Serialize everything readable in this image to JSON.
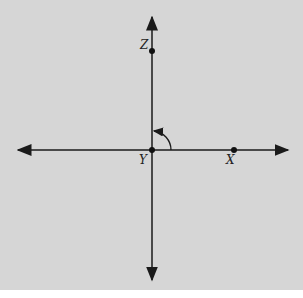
{
  "diagram": {
    "type": "coordinate-axes-with-points",
    "points": [
      {
        "label": "Z",
        "x": 152,
        "y": 51
      },
      {
        "label": "Y",
        "x": 152,
        "y": 150
      },
      {
        "label": "X",
        "x": 234,
        "y": 150
      }
    ],
    "angle_arrow": {
      "from": "X-direction",
      "to": "Z-direction",
      "center": "Y"
    },
    "colors": {
      "background": "#d6d6d6",
      "line": "#1a1a1a"
    }
  }
}
